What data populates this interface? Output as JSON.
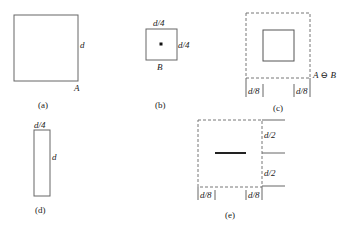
{
  "figure": {
    "panels": [
      {
        "id": "a",
        "caption": "(a)",
        "labels": {
          "side": "d",
          "set": "A"
        }
      },
      {
        "id": "b",
        "caption": "(b)",
        "labels": {
          "top": "d/4",
          "side": "d/4",
          "set": "B"
        }
      },
      {
        "id": "c",
        "caption": "(c)",
        "labels": {
          "result": "A ⊖ B",
          "left_margin": "d/8",
          "right_margin": "d/8"
        }
      },
      {
        "id": "d",
        "caption": "(d)",
        "labels": {
          "top": "d/4",
          "side": "d"
        }
      },
      {
        "id": "e",
        "caption": "(e)",
        "labels": {
          "upper_half": "d/2",
          "lower_half": "d/2",
          "left_margin": "d/8",
          "right_margin": "d/8"
        }
      }
    ],
    "colors": {
      "stroke": "#555555",
      "line": "#222222",
      "background": "#ffffff"
    }
  }
}
